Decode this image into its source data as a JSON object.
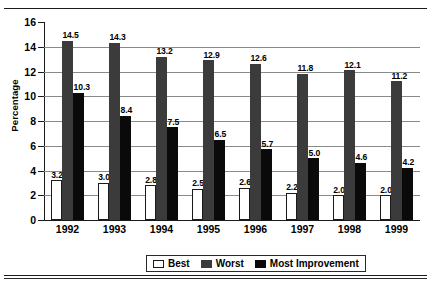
{
  "page": {
    "clipped_caption_remnant": "",
    "top_rule": true,
    "bottom_rule": true
  },
  "chart_data": {
    "type": "bar",
    "title": "",
    "xlabel": "",
    "ylabel": "Percentage",
    "ylim": [
      0,
      16
    ],
    "yticks": [
      0,
      2,
      4,
      6,
      8,
      10,
      12,
      14,
      16
    ],
    "grid": true,
    "legend_position": "bottom",
    "categories": [
      "1992",
      "1993",
      "1994",
      "1995",
      "1996",
      "1997",
      "1998",
      "1999"
    ],
    "series": [
      {
        "name": "Best",
        "color": "#ffffff",
        "values": [
          3.2,
          3.0,
          2.8,
          2.5,
          2.6,
          2.2,
          2.0,
          2.0
        ],
        "labels": [
          "3.2",
          "3.0",
          "2.8",
          "2.5",
          "2.6",
          "2.2",
          "2.0",
          "2.0"
        ]
      },
      {
        "name": "Worst",
        "color": "#3b3b3b",
        "values": [
          14.5,
          14.3,
          13.2,
          12.9,
          12.6,
          11.8,
          12.1,
          11.2
        ],
        "labels": [
          "14.5",
          "14.3",
          "13.2",
          "12.9",
          "12.6",
          "11.8",
          "12.1",
          "11.2"
        ]
      },
      {
        "name": "Most Improvement",
        "color": "#0a0a0a",
        "values": [
          10.3,
          8.4,
          7.5,
          6.5,
          5.7,
          5.0,
          4.6,
          4.2
        ],
        "labels": [
          "10.3",
          "8.4",
          "7.5",
          "6.5",
          "5.7",
          "5.0",
          "4.6",
          "4.2"
        ]
      }
    ]
  }
}
